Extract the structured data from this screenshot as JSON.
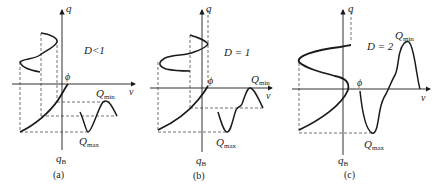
{
  "panels": [
    {
      "id": "a",
      "caption": "(a)",
      "condition": "D<1",
      "axis_v": "v",
      "axis_q": "q",
      "phi": "ϕ",
      "q_base": "q",
      "q_base_sub": "B",
      "q_upper": "Q",
      "q_upper_sub": "min",
      "q_lower": "Q",
      "q_lower_sub": "max"
    },
    {
      "id": "b",
      "caption": "(b)",
      "condition": "D = 1",
      "axis_v": "v",
      "axis_q": "q",
      "phi": "ϕ",
      "q_base": "q",
      "q_base_sub": "B",
      "q_upper": "Q",
      "q_upper_sub": "min",
      "q_lower": "Q",
      "q_lower_sub": "max"
    },
    {
      "id": "c",
      "caption": "(c)",
      "condition": "D = 2",
      "axis_v": "v",
      "axis_q": "q",
      "phi": "ϕ",
      "q_base": "q",
      "q_base_sub": "B",
      "q_upper": "Q",
      "q_upper_sub": "min",
      "q_lower": "Q",
      "q_lower_sub": "max"
    }
  ],
  "colors": {
    "stroke": "#1a1a1a",
    "dash": "#333333",
    "background": "#ffffff"
  }
}
